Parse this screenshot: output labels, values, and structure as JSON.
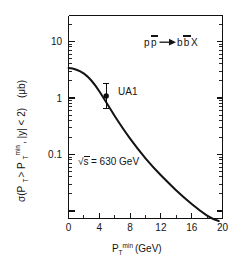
{
  "figure": {
    "background_color": "#ffffff",
    "ink_color": "#121212"
  },
  "chart_data": {
    "type": "line",
    "title": "",
    "subtitle": "",
    "xlabel": "P_T^min (GeV)",
    "xlabel_parts": {
      "base": "P",
      "subscript": "T",
      "superscript": "min",
      "unit": "(GeV)"
    },
    "ylabel": "σ(P_T > P_T^min , |y| < 2)   (μb)",
    "ylabel_parts": {
      "sigma": "σ(P",
      "sub1": "T",
      "gt": " > P",
      "sub2": "T",
      "sup2": "min",
      "rapidity": " , |y| < 2)",
      "unit": "(μb)"
    },
    "xscale": "linear",
    "yscale": "log",
    "xlim": [
      0,
      20
    ],
    "ylim": [
      0.02,
      20
    ],
    "grid": false,
    "legend": false,
    "xticks": [
      0,
      4,
      8,
      12,
      16,
      20
    ],
    "xtick_labels": [
      "0",
      "4",
      "8",
      "12",
      "16",
      "20"
    ],
    "xminor_ticks": [
      2,
      6,
      10,
      14,
      18
    ],
    "yticks": [
      10,
      1,
      0.1
    ],
    "ytick_labels": [
      "10",
      "1",
      "0.1"
    ],
    "yminor_decades": [
      2,
      3,
      4,
      5,
      6,
      7,
      8,
      9
    ],
    "series": [
      {
        "name": "QCD prediction",
        "style": "solid-curve",
        "color": "#121212",
        "x": [
          0,
          1,
          2,
          3,
          4,
          5,
          6,
          7,
          8,
          9,
          10,
          11,
          12,
          13,
          14,
          15,
          16,
          17,
          18,
          19,
          19.5
        ],
        "y": [
          3.3,
          3.2,
          2.95,
          2.45,
          1.85,
          1.3,
          0.88,
          0.58,
          0.38,
          0.25,
          0.165,
          0.108,
          0.071,
          0.047,
          0.031,
          0.021,
          0.014,
          0.0095,
          0.0063,
          0.0042,
          0.0034
        ]
      }
    ],
    "data_points": [
      {
        "label": "UA1",
        "x": 4.9,
        "y": 1.1,
        "yerr_low": 0.72,
        "yerr_high": 1.72,
        "marker": "filled-circle",
        "color": "#0b0b0b"
      }
    ],
    "annotations": [
      {
        "name": "reaction-label",
        "text": "pp̄ → bb̄X",
        "text_plain": "p pbar -> b bbar X",
        "x_px": 148,
        "y_px": 42
      },
      {
        "name": "energy-label",
        "text": "√s = 630 GeV",
        "value": "630",
        "unit": "GeV",
        "x_px": 78,
        "y_px": 161
      },
      {
        "name": "ua1-label",
        "text": "UA1",
        "x_px": 120,
        "y_px": 92
      }
    ]
  },
  "labels": {
    "reaction_p": "p",
    "reaction_pbar": "p",
    "reaction_arrow": "→",
    "reaction_b": "b",
    "reaction_bbar": "b",
    "reaction_X": "X",
    "ua1": "UA1",
    "sqrt_s_symbol": "√s",
    "sqrt_s_value": "= 630 GeV",
    "mu_b": "(μb)",
    "sigma_open": "σ(P",
    "sub_T_a": "T",
    "gt_p": "> P",
    "sub_T_b": "T",
    "sup_min_b": "min",
    "rapidity_close": ", |y| < 2)",
    "x_base": "P",
    "x_sub": "T",
    "x_sup": "min",
    "x_unit": "(GeV)",
    "ytick_10": "10",
    "ytick_1": "1",
    "ytick_01": "0.1",
    "xtick_0": "0",
    "xtick_4": "4",
    "xtick_8": "8",
    "xtick_12": "12",
    "xtick_16": "16",
    "xtick_20": "20"
  }
}
